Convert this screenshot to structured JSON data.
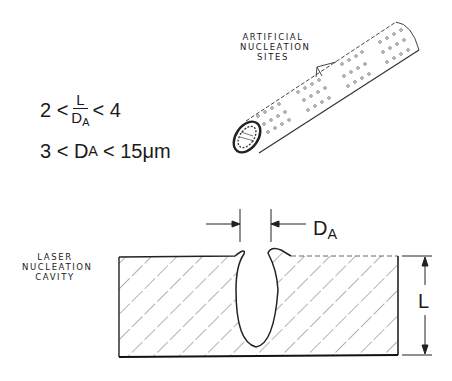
{
  "equations": {
    "ratio": {
      "lower": "2 <",
      "numerator": "L",
      "denominator": "D",
      "denominator_sub": "A",
      "upper": "< 4"
    },
    "diameter": {
      "lower": "3 < D",
      "sub": "A",
      "upper": "< 15μm"
    }
  },
  "tube": {
    "label_lines": [
      "ARTIFICIAL",
      "NUCLEATION",
      "SITES"
    ]
  },
  "cavity": {
    "label_lines": [
      "LASER",
      "NUCLEATION",
      "CAVITY"
    ],
    "diameter_label": "D",
    "diameter_sub": "A",
    "depth_label": "L"
  }
}
